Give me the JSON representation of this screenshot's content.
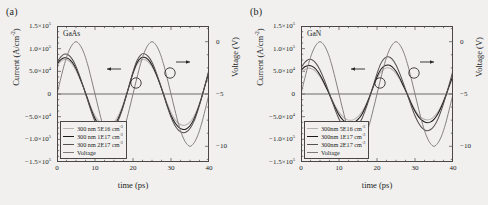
{
  "figure": {
    "background_color": "#f1f0ee",
    "axis_color": "#4a4746"
  },
  "panels": [
    {
      "panel_label": "(a)",
      "material": "GaAs",
      "axis_titles": {
        "x": "time (ps)",
        "y_left": "Current (A/cm",
        "y_left_sup": "-2",
        "y_left_close": ")",
        "y_right": "Voltage (V)"
      },
      "x_ticks": [
        "0",
        "10",
        "20",
        "30",
        "40"
      ],
      "x_tick_values": [
        0,
        10,
        20,
        30,
        40
      ],
      "y_left_ticks": [
        "1.5×10",
        "1.0×10",
        "5.0×10",
        "0",
        "−5.0×10",
        "−1.0×10",
        "−1.5×10"
      ],
      "y_left_sups": [
        "5",
        "5",
        "4",
        "",
        "4",
        "5",
        "5"
      ],
      "y_left_values": [
        150000,
        100000,
        50000,
        0,
        -50000,
        -100000,
        -150000
      ],
      "y_right_ticks": [
        "0",
        "−5",
        "−10"
      ],
      "y_right_values": [
        0,
        -5,
        -10
      ],
      "legend": [
        {
          "label": "300 nm 5E16 cm",
          "sup": "-3",
          "color": "#b6b3b0"
        },
        {
          "label": "300 nm 1E17 cm",
          "sup": "-3",
          "color": "#1c1a19"
        },
        {
          "label": "300 nm 2E17 cm",
          "sup": "-3",
          "color": "#55514f"
        },
        {
          "label": "Voltage",
          "sup": "",
          "color": "#7e7a77"
        }
      ],
      "annotations": [
        {
          "name": "left-arrow-annotation",
          "text": "←"
        },
        {
          "name": "right-arrow-annotation",
          "text": "→"
        }
      ]
    },
    {
      "panel_label": "(b)",
      "material": "GaN",
      "axis_titles": {
        "x": "time (ps)",
        "y_left": "Current (A/cm",
        "y_left_sup": "-2",
        "y_left_close": ")",
        "y_right": "Voltage (V)"
      },
      "x_ticks": [
        "0",
        "10",
        "20",
        "30",
        "40"
      ],
      "x_tick_values": [
        0,
        10,
        20,
        30,
        40
      ],
      "y_left_ticks": [
        "1.5×10",
        "1.0×10",
        "5.0×10",
        "0",
        "−5.0×10",
        "−1.0×10",
        "−1.5×10"
      ],
      "y_left_sups": [
        "5",
        "5",
        "4",
        "",
        "4",
        "5",
        "5"
      ],
      "y_left_values": [
        150000,
        100000,
        50000,
        0,
        -50000,
        -100000,
        -150000
      ],
      "y_right_ticks": [
        "0",
        "−5",
        "−10"
      ],
      "y_right_values": [
        0,
        -5,
        -10
      ],
      "legend": [
        {
          "label": "300nm 5E16 cm",
          "sup": "-3",
          "color": "#b6b3b0"
        },
        {
          "label": "300nm 1E17 cm",
          "sup": "-3",
          "color": "#1c1a19"
        },
        {
          "label": "300nm 2E17 cm",
          "sup": "-3",
          "color": "#55514f"
        },
        {
          "label": "Voltage",
          "sup": "",
          "color": "#7e7a77"
        }
      ],
      "annotations": [
        {
          "name": "left-arrow-annotation",
          "text": "←"
        },
        {
          "name": "right-arrow-annotation",
          "text": "→"
        }
      ]
    }
  ],
  "chart_data": [
    {
      "type": "line",
      "title": "GaAs",
      "panel": "(a)",
      "xlabel": "time (ps)",
      "ylabel": "Current (A/cm-2)",
      "y2label": "Voltage (V)",
      "xlim": [
        0,
        40
      ],
      "ylim": [
        -150000,
        150000
      ],
      "y2lim": [
        -11.5,
        1.5
      ],
      "grid": false,
      "legend_position": "lower-left",
      "x": [
        0,
        1,
        2,
        3,
        4,
        5,
        6,
        7,
        8,
        9,
        10,
        11,
        12,
        13,
        14,
        15,
        16,
        17,
        18,
        19,
        20,
        21,
        22,
        23,
        24,
        25,
        26,
        27,
        28,
        29,
        30,
        31,
        32,
        33,
        34,
        35,
        36,
        37,
        38,
        39,
        40
      ],
      "series": [
        {
          "name": "300 nm 5E16 cm-3",
          "axis": "left",
          "color": "#b6b3b0",
          "values": [
            62000,
            72000,
            76000,
            74000,
            66000,
            52000,
            34000,
            14000,
            -8000,
            -30000,
            -48000,
            -60000,
            -67000,
            -70000,
            -68000,
            -62000,
            -50000,
            -32000,
            -8000,
            20000,
            45000,
            64000,
            74000,
            76000,
            71000,
            60000,
            44000,
            24000,
            2000,
            -21000,
            -41000,
            -56000,
            -65000,
            -69000,
            -68000,
            -62000,
            -50000,
            -32000,
            -8000,
            20000,
            48000
          ]
        },
        {
          "name": "300 nm 1E17 cm-3",
          "axis": "left",
          "color": "#1c1a19",
          "values": [
            66000,
            76000,
            80000,
            78000,
            70000,
            56000,
            36000,
            14000,
            -10000,
            -34000,
            -54000,
            -68000,
            -76000,
            -79000,
            -77000,
            -70000,
            -56000,
            -36000,
            -10000,
            18000,
            46000,
            68000,
            79000,
            81000,
            76000,
            64000,
            46000,
            24000,
            0,
            -25000,
            -47000,
            -63000,
            -73000,
            -78000,
            -77000,
            -70000,
            -56000,
            -35000,
            -9000,
            20000,
            50000
          ]
        },
        {
          "name": "300 nm 2E17 cm-3",
          "axis": "left",
          "color": "#55514f",
          "values": [
            70000,
            82000,
            88000,
            86000,
            77000,
            61000,
            39000,
            14000,
            -12000,
            -38000,
            -60000,
            -75000,
            -84000,
            -87000,
            -84000,
            -76000,
            -61000,
            -39000,
            -11000,
            19000,
            49000,
            73000,
            86000,
            89000,
            83000,
            70000,
            50000,
            26000,
            0,
            -27000,
            -51000,
            -69000,
            -80000,
            -85000,
            -84000,
            -76000,
            -61000,
            -38000,
            -10000,
            21000,
            54000
          ]
        },
        {
          "name": "Voltage",
          "axis": "right",
          "color": "#7e7a77",
          "values": [
            -5.0,
            -3.5,
            -2.1,
            -1.0,
            -0.3,
            0.0,
            -0.3,
            -1.0,
            -2.1,
            -3.5,
            -5.0,
            -6.5,
            -7.9,
            -9.0,
            -9.7,
            -10.0,
            -9.7,
            -9.0,
            -7.9,
            -6.5,
            -5.0,
            -3.5,
            -2.1,
            -1.0,
            -0.3,
            0.0,
            -0.3,
            -1.0,
            -2.1,
            -3.5,
            -5.0,
            -6.5,
            -7.9,
            -9.0,
            -9.7,
            -10.0,
            -9.7,
            -9.0,
            -7.9,
            -6.5,
            -5.0
          ]
        }
      ]
    },
    {
      "type": "line",
      "title": "GaN",
      "panel": "(b)",
      "xlabel": "time (ps)",
      "ylabel": "Current (A/cm-2)",
      "y2label": "Voltage (V)",
      "xlim": [
        0,
        40
      ],
      "ylim": [
        -150000,
        150000
      ],
      "y2lim": [
        -11.5,
        1.5
      ],
      "grid": false,
      "legend_position": "lower-left",
      "x": [
        0,
        1,
        2,
        3,
        4,
        5,
        6,
        7,
        8,
        9,
        10,
        11,
        12,
        13,
        14,
        15,
        16,
        17,
        18,
        19,
        20,
        21,
        22,
        23,
        24,
        25,
        26,
        27,
        28,
        29,
        30,
        31,
        32,
        33,
        34,
        35,
        36,
        37,
        38,
        39,
        40
      ],
      "series": [
        {
          "name": "300nm 5E16 cm-3",
          "axis": "left",
          "color": "#b6b3b0",
          "values": [
            46000,
            54000,
            57000,
            55000,
            49000,
            38000,
            24000,
            8000,
            -9000,
            -26000,
            -40000,
            -50000,
            -56000,
            -58000,
            -56000,
            -50000,
            -40000,
            -25000,
            -6000,
            15000,
            34000,
            48000,
            56000,
            58000,
            54000,
            45000,
            32000,
            16000,
            -1000,
            -19000,
            -35000,
            -47000,
            -54000,
            -57000,
            -56000,
            -50000,
            -40000,
            -24000,
            -5000,
            16000,
            37000
          ]
        },
        {
          "name": "300nm 1E17 cm-3",
          "axis": "left",
          "color": "#1c1a19",
          "values": [
            52000,
            60000,
            63000,
            61000,
            54000,
            42000,
            26000,
            8000,
            -11000,
            -30000,
            -46000,
            -57000,
            -63000,
            -65000,
            -63000,
            -56000,
            -45000,
            -28000,
            -7000,
            16000,
            38000,
            54000,
            62000,
            64000,
            60000,
            50000,
            35000,
            17000,
            -1000,
            -21000,
            -38000,
            -51000,
            -59000,
            -63000,
            -62000,
            -56000,
            -44000,
            -27000,
            -6000,
            18000,
            41000
          ]
        },
        {
          "name": "300nm 2E17 cm-3",
          "axis": "left",
          "color": "#55514f",
          "values": [
            58000,
            70000,
            76000,
            75000,
            67000,
            53000,
            34000,
            12000,
            -12000,
            -35000,
            -55000,
            -69000,
            -77000,
            -80000,
            -77000,
            -69000,
            -55000,
            -34000,
            -9000,
            18000,
            45000,
            67000,
            79000,
            82000,
            77000,
            64000,
            45000,
            22000,
            -2000,
            -26000,
            -48000,
            -65000,
            -76000,
            -81000,
            -79000,
            -71000,
            -56000,
            -34000,
            -8000,
            21000,
            52000
          ]
        },
        {
          "name": "Voltage",
          "axis": "right",
          "color": "#7e7a77",
          "values": [
            -5.0,
            -3.5,
            -2.1,
            -1.0,
            -0.3,
            0.0,
            -0.3,
            -1.0,
            -2.1,
            -3.5,
            -5.0,
            -6.5,
            -7.9,
            -9.0,
            -9.7,
            -10.0,
            -9.7,
            -9.0,
            -7.9,
            -6.5,
            -5.0,
            -3.5,
            -2.1,
            -1.0,
            -0.3,
            0.0,
            -0.3,
            -1.0,
            -2.1,
            -3.5,
            -5.0,
            -6.5,
            -7.9,
            -9.0,
            -9.7,
            -10.0,
            -9.7,
            -9.0,
            -7.9,
            -6.5,
            -5.0
          ]
        }
      ]
    }
  ]
}
